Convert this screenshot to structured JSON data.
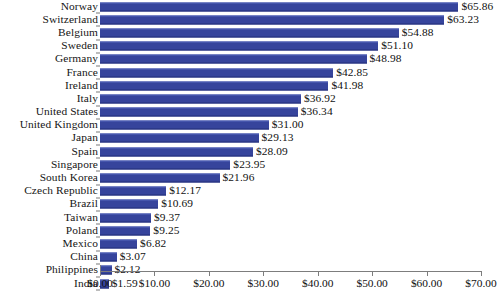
{
  "chart_data": {
    "type": "bar",
    "orientation": "horizontal",
    "title": "",
    "subtitle": "",
    "xlabel": "",
    "ylabel": "",
    "xlim": [
      0,
      70
    ],
    "grid": false,
    "legend": false,
    "legend_position": "none",
    "bar_color": "#36449c",
    "value_prefix": "$",
    "xtick_labels": [
      "$0.00",
      "$10.00",
      "$20.00",
      "$30.00",
      "$40.00",
      "$50.00",
      "$60.00",
      "$70.00"
    ],
    "xticks": [
      0,
      10,
      20,
      30,
      40,
      50,
      60,
      70
    ],
    "categories": [
      "Norway",
      "Switzerland",
      "Belgium",
      "Sweden",
      "Germany",
      "France",
      "Ireland",
      "Italy",
      "United States",
      "United Kingdom",
      "Japan",
      "Spain",
      "Singapore",
      "South Korea",
      "Czech Republic",
      "Brazil",
      "Taiwan",
      "Poland",
      "Mexico",
      "China",
      "Philippines",
      "India"
    ],
    "values": [
      65.86,
      63.23,
      54.88,
      51.1,
      48.98,
      42.85,
      41.98,
      36.92,
      36.34,
      31.0,
      29.13,
      28.09,
      23.95,
      21.96,
      12.17,
      10.69,
      9.37,
      9.25,
      6.82,
      3.07,
      2.12,
      1.59
    ],
    "value_labels": [
      "$65.86",
      "$63.23",
      "$54.88",
      "$51.10",
      "$48.98",
      "$42.85",
      "$41.98",
      "$36.92",
      "$36.34",
      "$31.00",
      "$29.13",
      "$28.09",
      "$23.95",
      "$21.96",
      "$12.17",
      "$10.69",
      "$9.37",
      "$9.25",
      "$6.82",
      "$3.07",
      "$2.12",
      "$1.59"
    ]
  }
}
